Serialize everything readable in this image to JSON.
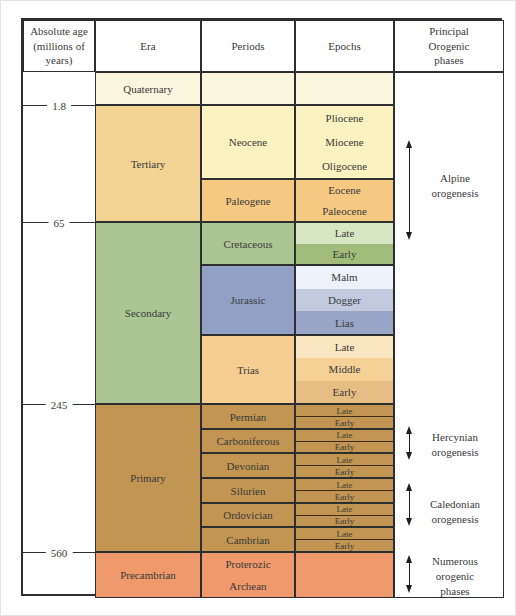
{
  "header": {
    "age": "Absolute age\n(millions of\nyears)",
    "era": "Era",
    "periods": "Periods",
    "epochs": "Epochs",
    "orogenic": "Principal\nOrogenic\nphases"
  },
  "age_markers": [
    "1.8",
    "65",
    "245",
    "560"
  ],
  "eras": {
    "quaternary": "Quaternary",
    "tertiary": "Tertiary",
    "secondary": "Secondary",
    "primary": "Primary",
    "precambrian": "Precambrian"
  },
  "periods": {
    "neocene": "Neocene",
    "paleogene": "Paleogene",
    "cretaceous": "Cretaceous",
    "jurassic": "Jurassic",
    "trias": "Trias",
    "permian": "Permian",
    "carboniferous": "Carboniferous",
    "devonian": "Devonian",
    "silurien": "Silurien",
    "ordovician": "Ordovician",
    "cambrian": "Cambrian",
    "proterozic": "Proterozic",
    "archean": "Archean"
  },
  "epochs": {
    "neocene": [
      "Pliocene",
      "Miocene",
      "Oligocene"
    ],
    "paleogene": [
      "Eocene",
      "Paleocene"
    ],
    "cretaceous": [
      "Late",
      "Early"
    ],
    "jurassic": [
      "Malm",
      "Dogger",
      "Lias"
    ],
    "trias": [
      "Late",
      "Middle",
      "Early"
    ],
    "permian": [
      "Late",
      "Early"
    ],
    "carboniferous": [
      "Late",
      "Early"
    ],
    "devonian": [
      "Late",
      "Early"
    ],
    "silurien": [
      "Late",
      "Early"
    ],
    "ordovician": [
      "Late",
      "Early"
    ],
    "cambrian": [
      "Late",
      "Early"
    ]
  },
  "orogenic_phases": {
    "alpine": "Alpine\norogenesis",
    "hercynian": "Hercynian\norogenesis",
    "caledonian": "Caledonian\norogenesis",
    "numerous": "Numerous\norogenic\nphases"
  },
  "colors": {
    "quaternary_row": "#FBF7DE",
    "neocene": "#FAF2C0",
    "tertiary": "#F3D394",
    "paleogene": "#F5C981",
    "secondary": "#ABC693",
    "cretaceous_late": "#D7E6C3",
    "cretaceous_early": "#A2BD7B",
    "jurassic": "#92A0C6",
    "malm": "#EDF1F9",
    "dogger": "#C2CADF",
    "lias": "#99A4C6",
    "trias": "#F6CE93",
    "trias_late": "#F9E5BF",
    "trias_middle": "#F5D197",
    "trias_early": "#E6BD85",
    "primary": "#C29552",
    "precambrian": "#F0996C",
    "border": "#2e2e2e"
  }
}
